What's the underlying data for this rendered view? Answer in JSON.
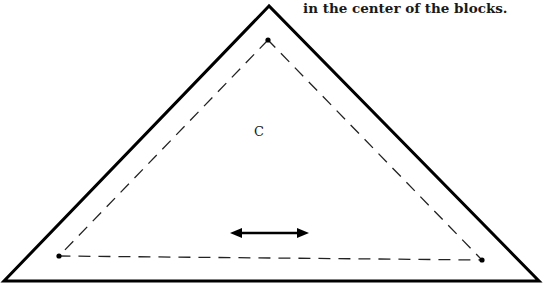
{
  "caption": "in the center of the blocks.",
  "piece": {
    "label": "C",
    "grain_arrow": "double-headed-arrow",
    "colors": {
      "stroke": "#000000",
      "background": "#ffffff"
    }
  }
}
